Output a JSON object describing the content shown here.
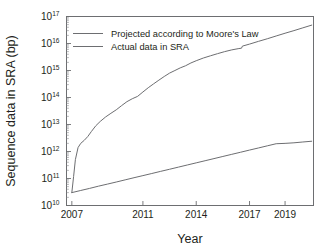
{
  "figure": {
    "background_color": "#ffffff",
    "line_color": "#6d6e71",
    "text_color": "#231f20"
  },
  "chart_data": {
    "type": "line",
    "title": "",
    "xlabel": "Year",
    "ylabel": "Sequence data in SRA (bp)",
    "yscale": "log",
    "xlim": [
      2006.7,
      2020.6
    ],
    "ylim": [
      10000000000.0,
      1e+17
    ],
    "grid": false,
    "legend_position": "top-left",
    "xticks": [
      2007,
      2011,
      2014,
      2017,
      2019
    ],
    "xtick_labels": [
      "2007",
      "2011",
      "2014",
      "2017",
      "2019"
    ],
    "yticks": [
      10000000000.0,
      100000000000.0,
      1000000000000.0,
      10000000000000.0,
      100000000000000.0,
      1000000000000000.0,
      1e+16,
      1e+17
    ],
    "ytick_labels": [
      "10^10",
      "10^11",
      "10^12",
      "10^13",
      "10^14",
      "10^15",
      "10^16",
      "10^17"
    ],
    "ytick_mantissa": "10",
    "ytick_exponents": [
      "10",
      "11",
      "12",
      "13",
      "14",
      "15",
      "16",
      "17"
    ],
    "series": [
      {
        "name": "Projected according to Moore's Law",
        "color": "#6d6e71",
        "x": [
          2007.0,
          2007.1,
          2007.2,
          2007.35,
          2007.5,
          2007.7,
          2007.9,
          2008.1,
          2008.35,
          2008.6,
          2008.9,
          2009.2,
          2009.5,
          2009.8,
          2010.1,
          2010.4,
          2010.7,
          2011.0,
          2011.3,
          2011.6,
          2011.9,
          2012.2,
          2012.5,
          2012.8,
          2013.1,
          2013.4,
          2013.7,
          2014.0,
          2014.4,
          2014.8,
          2015.2,
          2015.6,
          2016.0,
          2016.4,
          2016.55,
          2016.6,
          2017.0,
          2017.5,
          2018.0,
          2018.5,
          2019.0,
          2019.5,
          2020.0,
          2020.5
        ],
        "y": [
          30000000000.0,
          120000000000.0,
          500000000000.0,
          1400000000000.0,
          2000000000000.0,
          2600000000000.0,
          3600000000000.0,
          5500000000000.0,
          9000000000000.0,
          13000000000000.0,
          19000000000000.0,
          26000000000000.0,
          35000000000000.0,
          50000000000000.0,
          70000000000000.0,
          90000000000000.0,
          110000000000000.0,
          160000000000000.0,
          230000000000000.0,
          320000000000000.0,
          440000000000000.0,
          600000000000000.0,
          800000000000000.0,
          1000000000000000.0,
          1250000000000000.0,
          1500000000000000.0,
          1900000000000000.0,
          2300000000000000.0,
          2900000000000000.0,
          3500000000000000.0,
          4200000000000000.0,
          5000000000000000.0,
          5800000000000000.0,
          6500000000000000.0,
          6700000000000000.0,
          8000000000000000.0,
          9500000000000000.0,
          1.2e+16,
          1.5e+16,
          1.9e+16,
          2.4e+16,
          3e+16,
          3.8e+16,
          4.8e+16
        ]
      },
      {
        "name": "Actual data in SRA",
        "color": "#6d6e71",
        "x": [
          2007.0,
          2007.5,
          2008.0,
          2008.5,
          2009.0,
          2009.5,
          2010.0,
          2010.5,
          2011.0,
          2011.5,
          2012.0,
          2012.5,
          2013.0,
          2013.5,
          2014.0,
          2014.5,
          2015.0,
          2015.5,
          2016.0,
          2016.5,
          2017.0,
          2017.5,
          2018.0,
          2018.5,
          2019.0,
          2019.5,
          2020.0,
          2020.5
        ],
        "y": [
          30000000000.0,
          36000000000.0,
          43000000000.0,
          52000000000.0,
          62000000000.0,
          74000000000.0,
          89000000000.0,
          107000000000.0,
          128000000000.0,
          153000000000.0,
          184000000000.0,
          220000000000.0,
          264000000000.0,
          317000000000.0,
          380000000000.0,
          455000000000.0,
          546000000000.0,
          655000000000.0,
          785000000000.0,
          940000000000.0,
          1130000000000.0,
          1350000000000.0,
          1620000000000.0,
          1940000000000.0,
          2000000000000.0,
          2100000000000.0,
          2250000000000.0,
          2400000000000.0
        ]
      }
    ],
    "legend": [
      {
        "label": "Projected according to Moore's Law"
      },
      {
        "label": "Actual data in SRA"
      }
    ]
  }
}
